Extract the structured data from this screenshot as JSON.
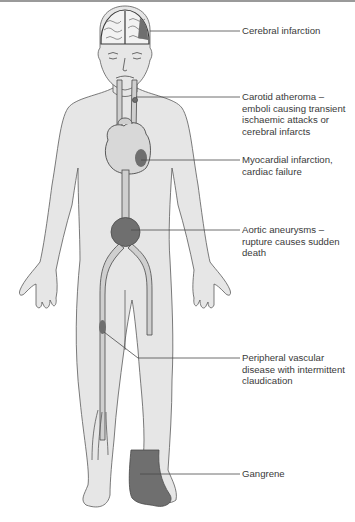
{
  "figure": {
    "colors": {
      "skin": "#e6e6e6",
      "outline": "#5a5a5a",
      "vessel": "#cfcfcf",
      "lesion": "#6f6f6f",
      "leader": "#4a4a4a",
      "text": "#3a3a3a"
    },
    "labels": [
      {
        "id": "cerebral",
        "text": "Cerebral infarction",
        "y": 26
      },
      {
        "id": "carotid",
        "text": "Carotid atheroma –\nemboli causing transient\nischaemic attacks or\ncerebral infarcts",
        "y": 91
      },
      {
        "id": "myocardial",
        "text": "Myocardial infarction,\ncardiac failure",
        "y": 155
      },
      {
        "id": "aortic",
        "text": "Aortic aneurysms –\nrupture causes sudden\ndeath",
        "y": 224
      },
      {
        "id": "peripheral",
        "text": "Peripheral vascular\ndisease with intermittent\nclaudication",
        "y": 355
      },
      {
        "id": "gangrene",
        "text": "Gangrene",
        "y": 470
      }
    ]
  }
}
